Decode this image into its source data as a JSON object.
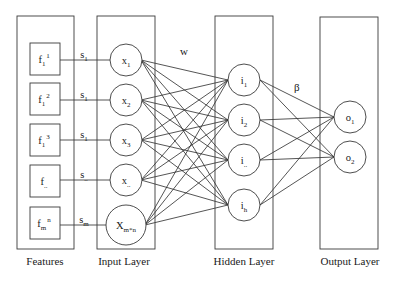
{
  "diagram": {
    "type": "neural-network",
    "groups": {
      "features": {
        "label": "Features",
        "x": 17,
        "y": 16,
        "w": 57,
        "h": 233
      },
      "input": {
        "label": "Input Layer",
        "x": 97,
        "y": 16,
        "w": 58,
        "h": 233
      },
      "hidden": {
        "label": "Hidden Layer",
        "x": 215,
        "y": 16,
        "w": 58,
        "h": 233
      },
      "output": {
        "label": "Output Layer",
        "x": 320,
        "y": 17,
        "w": 58,
        "h": 232
      }
    },
    "features": [
      {
        "base": "f",
        "sub": "1",
        "sup": "1",
        "y": 59,
        "edge_label": {
          "base": "s",
          "sub": "1"
        }
      },
      {
        "base": "f",
        "sub": "1",
        "sup": "2",
        "y": 99,
        "edge_label": {
          "base": "s",
          "sub": "1"
        }
      },
      {
        "base": "f",
        "sub": "1",
        "sup": "3",
        "y": 140,
        "edge_label": {
          "base": "s",
          "sub": "1"
        }
      },
      {
        "base": "f",
        "sub": "..",
        "sup": "",
        "y": 181,
        "edge_label": {
          "base": "s",
          "sub": ".."
        }
      },
      {
        "base": "f",
        "sub": "m",
        "sup": "n",
        "y": 223,
        "edge_label": {
          "base": "s",
          "sub": "m"
        }
      }
    ],
    "input_nodes": [
      {
        "base": "x",
        "sub": "1",
        "y": 60,
        "r": 16
      },
      {
        "base": "x",
        "sub": "2",
        "y": 100,
        "r": 16
      },
      {
        "base": "x",
        "sub": "3",
        "y": 140,
        "r": 16
      },
      {
        "base": "x",
        "sub": "..",
        "y": 180,
        "r": 16
      },
      {
        "base": "X",
        "sub": "m*n",
        "y": 225,
        "r": 20
      }
    ],
    "hidden_nodes": [
      {
        "base": "i",
        "sub": "1",
        "y": 80
      },
      {
        "base": "i",
        "sub": "2",
        "y": 120
      },
      {
        "base": "i",
        "sub": "..",
        "y": 160
      },
      {
        "base": "i",
        "sub": "h",
        "y": 205
      }
    ],
    "output_nodes": [
      {
        "base": "o",
        "sub": "1",
        "y": 117
      },
      {
        "base": "o",
        "sub": "2",
        "y": 157
      }
    ],
    "weight_labels": {
      "input_to_hidden": "w",
      "hidden_to_output": "β"
    },
    "connectivity": "fully-connected input→hidden and hidden→output"
  }
}
